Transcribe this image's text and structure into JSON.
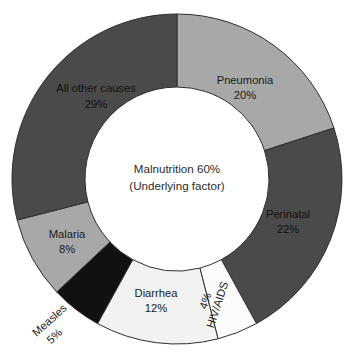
{
  "chart_data": {
    "type": "pie",
    "variant": "donut",
    "title": "",
    "subtitle": "",
    "xlabel": "",
    "ylabel": "",
    "grid": false,
    "legend": "none",
    "value_unit": "%",
    "start_angle_deg": 0,
    "direction": "clockwise",
    "center_label": {
      "line1": "Malnutrition 60%",
      "line2": "(Underlying factor)"
    },
    "categories": [
      "Pneumonia",
      "Perinatal",
      "HIV/AIDS",
      "Diarrhea",
      "Measles",
      "Malaria",
      "All other causes"
    ],
    "values": [
      20,
      22,
      4,
      12,
      5,
      8,
      29
    ],
    "value_labels": [
      "20%",
      "22%",
      "4%",
      "12%",
      "5%",
      "8%",
      "29%"
    ],
    "colors": [
      "#a8a8a8",
      "#4a4a4a",
      "#fbfbfb",
      "#f2f2f2",
      "#111111",
      "#a8a8a8",
      "#4a4a4a"
    ],
    "slices": [
      {
        "label": "Pneumonia",
        "value": 20,
        "value_label": "20%",
        "color": "#a8a8a8",
        "label_x": 245,
        "label_y": 84,
        "value_x": 245,
        "value_y": 99,
        "rotate": 0,
        "text_class": "slice-label"
      },
      {
        "label": "Perinatal",
        "value": 22,
        "value_label": "22%",
        "color": "#4a4a4a",
        "label_x": 288,
        "label_y": 218,
        "value_x": 288,
        "value_y": 233,
        "rotate": 0,
        "text_class": "slice-label on-dark"
      },
      {
        "label": "HIV/AIDS",
        "value": 4,
        "value_label": "4%",
        "color": "#fbfbfb",
        "label_x": 221,
        "label_y": 306,
        "value_x": 209,
        "value_y": 302,
        "rotate": -72,
        "text_class": "slice-label"
      },
      {
        "label": "Diarrhea",
        "value": 12,
        "value_label": "12%",
        "color": "#f2f2f2",
        "label_x": 156,
        "label_y": 297,
        "value_x": 156,
        "value_y": 312,
        "rotate": 0,
        "text_class": "slice-label"
      },
      {
        "label": "Measles",
        "value": 5,
        "value_label": "5%",
        "color": "#111111",
        "label_x": 52,
        "label_y": 323,
        "value_x": 57,
        "value_y": 339,
        "rotate": -42,
        "text_class": "slice-label"
      },
      {
        "label": "Malaria",
        "value": 8,
        "value_label": "8%",
        "color": "#a8a8a8",
        "label_x": 67,
        "label_y": 238,
        "value_x": 67,
        "value_y": 253,
        "rotate": 0,
        "text_class": "slice-label"
      },
      {
        "label": "All other causes",
        "value": 29,
        "value_label": "29%",
        "color": "#4a4a4a",
        "label_x": 96,
        "label_y": 92,
        "value_x": 96,
        "value_y": 108,
        "rotate": 0,
        "text_class": "slice-label on-dark"
      }
    ],
    "geometry": {
      "cx": 177,
      "cy": 179,
      "outer_radius": 165,
      "inner_radius": 92
    }
  }
}
